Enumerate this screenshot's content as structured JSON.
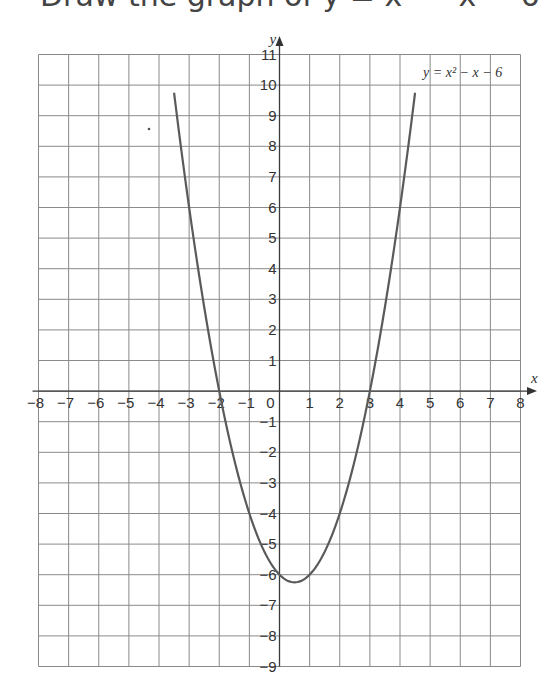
{
  "page": {
    "cropped_heading": "Draw the graph of y = x² − x − 6"
  },
  "chart_data": {
    "type": "line",
    "title": "",
    "xlabel": "x",
    "ylabel": "y",
    "xlim": [
      -8,
      8
    ],
    "ylim": [
      -9,
      11
    ],
    "grid": true,
    "legend": null,
    "x_ticks": [
      -8,
      -7,
      -6,
      -5,
      -4,
      -3,
      -2,
      -1,
      0,
      1,
      2,
      3,
      4,
      5,
      6,
      7,
      8
    ],
    "y_ticks": [
      11,
      10,
      9,
      8,
      7,
      6,
      5,
      4,
      3,
      2,
      1,
      -1,
      -2,
      -3,
      -4,
      -5,
      -6,
      -7,
      -8,
      -9
    ],
    "annotations": [
      {
        "text": "y = x² − x − 6",
        "x": 4.8,
        "y": 10.5
      }
    ],
    "series": [
      {
        "name": "y = x² − x − 6",
        "x": [
          -3.5,
          -3,
          -2.5,
          -2,
          -1.5,
          -1,
          -0.5,
          0,
          0.5,
          1,
          1.5,
          2,
          2.5,
          3,
          3.5,
          4,
          4.5
        ],
        "y": [
          10.75,
          6,
          2.75,
          0,
          -2.25,
          -4,
          -5.25,
          -6,
          -6.25,
          -6,
          -5.25,
          -4,
          -2.25,
          0,
          2.75,
          6,
          10.75
        ]
      }
    ],
    "roots": [
      -2,
      3
    ],
    "vertex": [
      0.5,
      -6.25
    ]
  }
}
